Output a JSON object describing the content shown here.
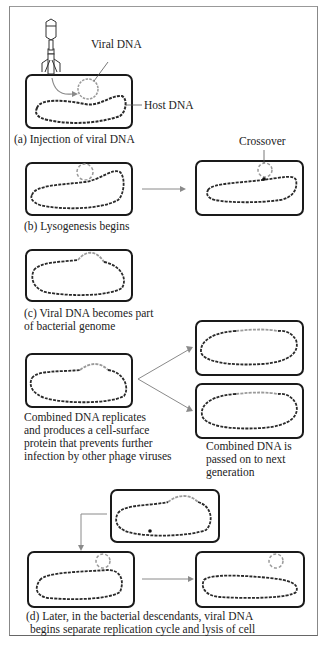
{
  "figure": {
    "panel_a": {
      "caption": "(a)   Injection of viral DNA",
      "labels": {
        "viral_dna": "Viral DNA",
        "host_dna": "Host DNA"
      }
    },
    "panel_b": {
      "caption": "(b)   Lysogenesis begins",
      "labels": {
        "crossover": "Crossover"
      }
    },
    "panel_c": {
      "caption_line1": "(c)   Viral DNA becomes part",
      "caption_line2": "of bacterial genome"
    },
    "replication": {
      "caption_line1": "Combined DNA replicates",
      "caption_line2": "and produces a cell-surface",
      "caption_line3": "protein that prevents further",
      "caption_line4": "infection by other phage viruses",
      "result_line1": "Combined DNA is",
      "result_line2": "passed on to next",
      "result_line3": "generation"
    },
    "panel_d": {
      "caption_line1": "(d)   Later, in the bacterial descendants, viral DNA",
      "caption_line2": "begins separate replication cycle and lysis of cell"
    },
    "colors": {
      "cell_border": "#1a1a1a",
      "host_dna": "#2a2a2a",
      "viral_dna": "#9a9a9a",
      "arrow": "#8a8a8a"
    }
  }
}
